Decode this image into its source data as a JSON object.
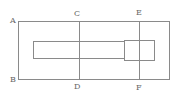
{
  "diagram": {
    "type": "geometry-figure",
    "labels": {
      "A": "A",
      "B": "B",
      "C": "C",
      "D": "D",
      "E": "E",
      "F": "F"
    },
    "segments": [
      "AB",
      "CD",
      "EF"
    ],
    "shapes": [
      "outer-rectangle",
      "long-inner-rectangle",
      "small-square"
    ],
    "colors": {
      "line": "#8a8a8a",
      "label": "#666666",
      "background": "#ffffff"
    }
  }
}
